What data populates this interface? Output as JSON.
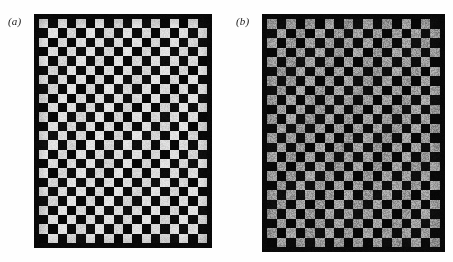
{
  "figure": {
    "kind": "scanned-figure",
    "background_color": "#fefefe",
    "panels": [
      {
        "id": "a",
        "label": "(a)",
        "description": "High-contrast checkerboard: light squares are near white on a black ground",
        "grid": {
          "columns": 18,
          "rows": 24
        },
        "colors": {
          "dark_square": "#0a0a0a",
          "light_square": "#d9d9d9",
          "border": "#0a0a0a"
        },
        "geometry": {
          "left": 34,
          "top": 14,
          "width": 178,
          "height": 234,
          "border_px": 5,
          "cell_px": 9.3
        },
        "parity_offset": 0
      },
      {
        "id": "b",
        "label": "(b)",
        "description": "Reduced-contrast checkerboard: light squares are mid gray on the same black ground",
        "grid": {
          "columns": 18,
          "rows": 24
        },
        "colors": {
          "dark_square": "#0a0a0a",
          "light_square": "#9b9b9b",
          "border": "#0a0a0a"
        },
        "geometry": {
          "left": 262,
          "top": 14,
          "width": 183,
          "height": 238,
          "border_px": 5,
          "cell_px": 9.6
        },
        "parity_offset": 0
      }
    ]
  },
  "chart_data": {
    "type": "heatmap",
    "title": "",
    "xlabel": "",
    "ylabel": "",
    "grid": false,
    "legend_position": "none",
    "annotations": [
      "(a)",
      "(b)"
    ],
    "panels": [
      {
        "name": "(a)",
        "columns": 18,
        "rows": 24,
        "pattern": "checkerboard",
        "values": {
          "light": 217,
          "dark": 10
        },
        "contrast_ratio_approx": 21.7
      },
      {
        "name": "(b)",
        "columns": 18,
        "rows": 24,
        "pattern": "checkerboard",
        "values": {
          "light": 155,
          "dark": 10
        },
        "contrast_ratio_approx": 15.5
      }
    ]
  }
}
